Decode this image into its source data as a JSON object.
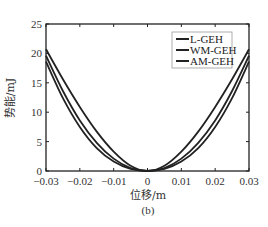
{
  "chart_data": {
    "type": "line",
    "title": "",
    "xlabel": "位移/m",
    "ylabel": "势能/mJ",
    "caption": "(b)",
    "xlim": [
      -0.03,
      0.03
    ],
    "ylim": [
      0,
      25
    ],
    "xticks": [
      -0.03,
      -0.02,
      -0.01,
      0,
      0.01,
      0.02,
      0.03
    ],
    "xtick_labels": [
      "-0.03",
      "-0.02",
      "-0.01",
      "0",
      "0.01",
      "0.02",
      "0.03"
    ],
    "yticks": [
      0,
      5,
      10,
      15,
      20,
      25
    ],
    "ytick_labels": [
      "0",
      "5",
      "10",
      "15",
      "20",
      "25"
    ],
    "grid": false,
    "legend_position": "upper right",
    "x": [
      -0.03,
      -0.025,
      -0.02,
      -0.015,
      -0.01,
      -0.005,
      0,
      0.005,
      0.01,
      0.015,
      0.02,
      0.025,
      0.03
    ],
    "series": [
      {
        "name": "L-GEH",
        "color": "#222222",
        "values": [
          20.7,
          15.6,
          10.9,
          6.7,
          3.3,
          0.9,
          0,
          0.9,
          3.3,
          6.7,
          10.9,
          15.6,
          20.7
        ]
      },
      {
        "name": "WM-GEH",
        "color": "#222222",
        "values": [
          19.6,
          13.6,
          8.6,
          4.8,
          2.1,
          0.5,
          0,
          0.5,
          2.1,
          4.8,
          8.6,
          13.6,
          19.6
        ]
      },
      {
        "name": "AM-GEH",
        "color": "#222222",
        "values": [
          18.6,
          12.4,
          7.5,
          3.9,
          1.6,
          0.35,
          0,
          0.35,
          1.6,
          3.9,
          7.5,
          12.4,
          18.6
        ]
      }
    ]
  },
  "legend": {
    "items": [
      {
        "label": "L-GEH"
      },
      {
        "label": "WM-GEH"
      },
      {
        "label": "AM-GEH"
      }
    ]
  }
}
